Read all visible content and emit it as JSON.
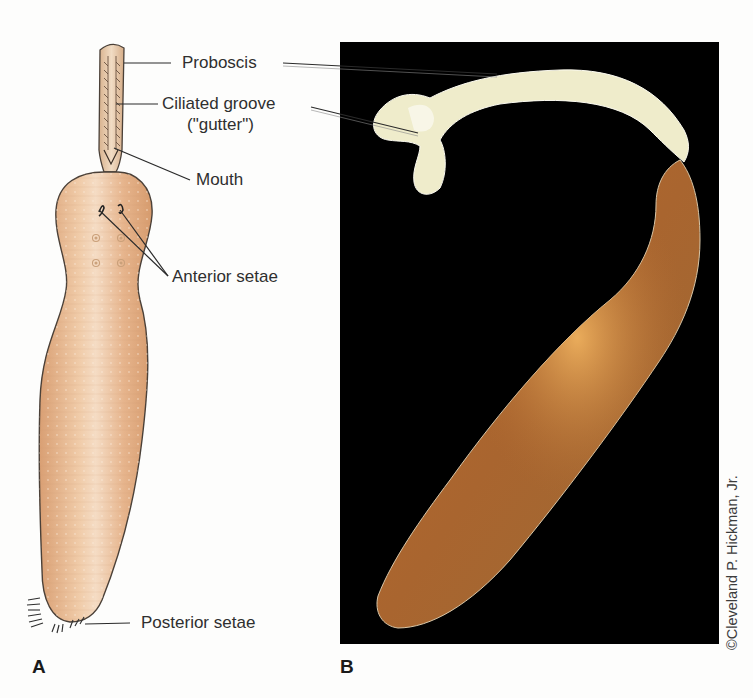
{
  "figure": {
    "panels": [
      {
        "letter": "A",
        "kind": "illustration",
        "subject": "echiuran worm, drawing"
      },
      {
        "letter": "B",
        "kind": "photograph",
        "subject": "echiuran worm, photograph",
        "background": "#000000"
      }
    ],
    "labels": {
      "proboscis": "Proboscis",
      "ciliated_groove_line1": "Ciliated groove",
      "ciliated_groove_line2": "(\"gutter\")",
      "mouth": "Mouth",
      "anterior_setae": "Anterior setae",
      "posterior_setae": "Posterior setae"
    },
    "panel_a_letter": "A",
    "panel_b_letter": "B",
    "credit": "©Cleveland P. Hickman, Jr.",
    "colors": {
      "page_background": "#fdfdfc",
      "illustration_body": "#e6b48c",
      "illustration_body_highlight": "#f3d7bd",
      "illustration_outline": "#4a4038",
      "proboscis_fill": "#e9cdb0",
      "photo_background": "#000000",
      "photo_proboscis": "#efeccb",
      "photo_trunk": "#a8642e",
      "photo_trunk_highlight": "#dd9a4c",
      "leader_line": "#2a2a2a"
    }
  }
}
